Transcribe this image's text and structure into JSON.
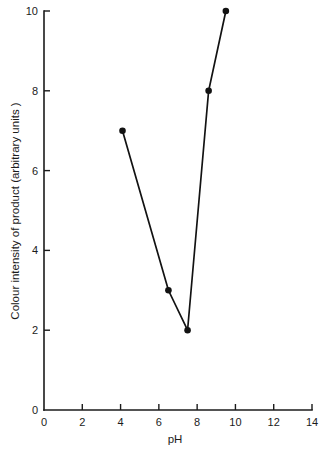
{
  "chart_data": {
    "type": "line",
    "title": "",
    "subtitle": "",
    "xlabel": "pH",
    "ylabel": "Colour intensity of product (arbitrary units )",
    "xlim": [
      0,
      14
    ],
    "ylim": [
      0,
      10
    ],
    "xticks": [
      0,
      2,
      4,
      6,
      8,
      10,
      12,
      14
    ],
    "xtick_labels": [
      "0",
      "2",
      "4",
      "6",
      "8",
      "10",
      "12",
      "14"
    ],
    "yticks": [
      0,
      2,
      4,
      6,
      8,
      10
    ],
    "ytick_labels": [
      "0",
      "2",
      "4",
      "6",
      "8",
      "10"
    ],
    "grid": false,
    "legend": false,
    "legend_position": "none",
    "marker": "filled-circle",
    "line_color": "#121212",
    "marker_color": "#121212",
    "background_color": "#ffffff",
    "series": [
      {
        "name": "Colour intensity of product",
        "points": [
          {
            "x": 4.1,
            "y": 7
          },
          {
            "x": 6.5,
            "y": 3
          },
          {
            "x": 7.5,
            "y": 2
          },
          {
            "x": 8.6,
            "y": 8
          },
          {
            "x": 9.5,
            "y": 10
          }
        ],
        "x": [
          4.1,
          6.5,
          7.5,
          8.6,
          9.5
        ],
        "values": [
          7,
          3,
          2,
          8,
          10
        ]
      }
    ],
    "annotations": []
  }
}
